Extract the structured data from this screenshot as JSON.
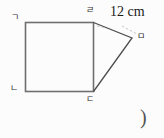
{
  "figure": {
    "type": "geometry-diagram",
    "vertices": [
      {
        "label": "ㄱ"
      },
      {
        "label": "ㄴ"
      },
      {
        "label": "ㄷ"
      },
      {
        "label": "ㄹ"
      },
      {
        "label": "ㅁ"
      }
    ],
    "measurement_label": "12 cm",
    "answer_paren": ")"
  },
  "colors": {
    "background": "#fcfcfc",
    "square_line": "#6f6f6f",
    "triangle_line": "#4d4d4d",
    "label_text": "#2e2e2e",
    "measurement_text": "#1b1b1b",
    "paren_text": "#555555",
    "leader_dash": "#b9b9b9"
  }
}
